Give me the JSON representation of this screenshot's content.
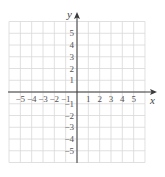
{
  "diagram": {
    "type": "coordinate-grid",
    "x_axis_label": "x",
    "y_axis_label": "y",
    "x_range": [
      -6,
      6
    ],
    "y_range": [
      -6,
      6
    ],
    "x_tick_labels": [
      "-5",
      "-4",
      "-3",
      "-2",
      "-1",
      "1",
      "2",
      "3",
      "4",
      "5"
    ],
    "y_tick_labels": [
      "5",
      "4",
      "3",
      "2",
      "1",
      "-1",
      "-2",
      "-3",
      "-4",
      "-5"
    ],
    "grid_color": "#d8d8d8",
    "axis_color": "#3a3a3a"
  }
}
